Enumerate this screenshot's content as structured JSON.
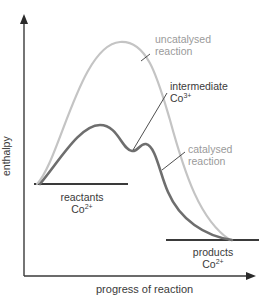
{
  "diagram": {
    "axes": {
      "y_label": "enthalpy",
      "x_label": "progress of reaction"
    },
    "levels": {
      "reactants": {
        "label": "reactants",
        "species": "Co",
        "charge": "2+"
      },
      "products": {
        "label": "products",
        "species": "Co",
        "charge": "2+"
      }
    },
    "curves": {
      "uncatalysed": {
        "label_line1": "uncatalysed",
        "label_line2": "reaction",
        "color": "#c4c4c4"
      },
      "catalysed": {
        "label_line1": "catalysed",
        "label_line2": "reaction",
        "color": "#6e6e6e"
      }
    },
    "intermediate": {
      "label": "intermediate",
      "species": "Co",
      "charge": "3+"
    },
    "colors": {
      "axis": "#3a3a3a",
      "level_line": "#3a3a3a",
      "leader_line": "#3a3a3a",
      "text_dark": "#3a3a3a",
      "text_light": "#9a9a9a"
    }
  }
}
